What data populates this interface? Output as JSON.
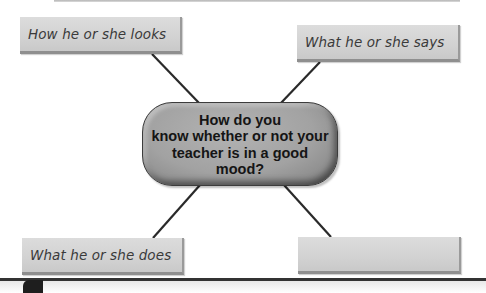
{
  "diagram": {
    "type": "concept-web",
    "center": {
      "text": "How do you\nknow whether or not your\nteacher is in a good\nmood?"
    },
    "nodes": [
      {
        "id": "top-left",
        "text": "How he or she looks"
      },
      {
        "id": "top-right",
        "text": "What he or she says"
      },
      {
        "id": "bottom-left",
        "text": "What he or she does"
      },
      {
        "id": "bottom-right",
        "text": ""
      }
    ],
    "colors": {
      "box_fill": "#d4d4d4",
      "hub_fill": "#a4a4a4",
      "connector": "#2a2a2a",
      "text": "#3a3a3a"
    }
  }
}
